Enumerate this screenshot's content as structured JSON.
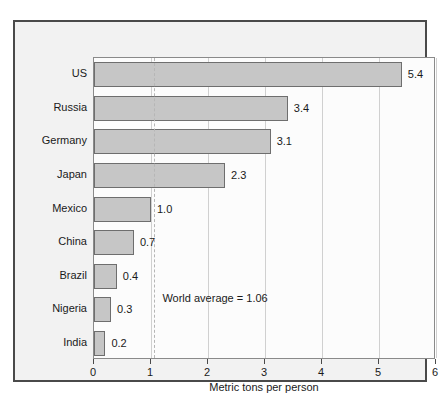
{
  "chart_data": {
    "type": "bar",
    "orientation": "horizontal",
    "title": "",
    "xlabel": "Metric tons per person",
    "ylabel": "",
    "categories": [
      "US",
      "Russia",
      "Germany",
      "Japan",
      "Mexico",
      "China",
      "Brazil",
      "Nigeria",
      "India"
    ],
    "values": [
      5.4,
      3.4,
      3.1,
      2.3,
      1.0,
      0.7,
      0.4,
      0.3,
      0.2
    ],
    "value_labels": [
      "5.4",
      "3.4",
      "3.1",
      "2.3",
      "1.0",
      "0.7",
      "0.4",
      "0.3",
      "0.2"
    ],
    "xlim": [
      0,
      6
    ],
    "xticks": [
      0,
      1,
      2,
      3,
      4,
      5,
      6
    ],
    "xtick_labels": [
      "0",
      "1",
      "2",
      "3",
      "4",
      "5",
      "6"
    ],
    "grid": true,
    "legend": "none",
    "annotations": [
      {
        "text": "World average = 1.06",
        "value": 1.06,
        "line_style": "dashed"
      }
    ],
    "colors": {
      "bar_fill": "#c6c6c6",
      "bar_stroke": "#6e6e6e",
      "plot_background": "#fcfcfc",
      "panel_background": "#f2f2f2",
      "frame": "#4a4a4a",
      "gridline": "#d0d0d0",
      "average_line": "#b6b6b6",
      "text": "#1a1a1a"
    }
  }
}
